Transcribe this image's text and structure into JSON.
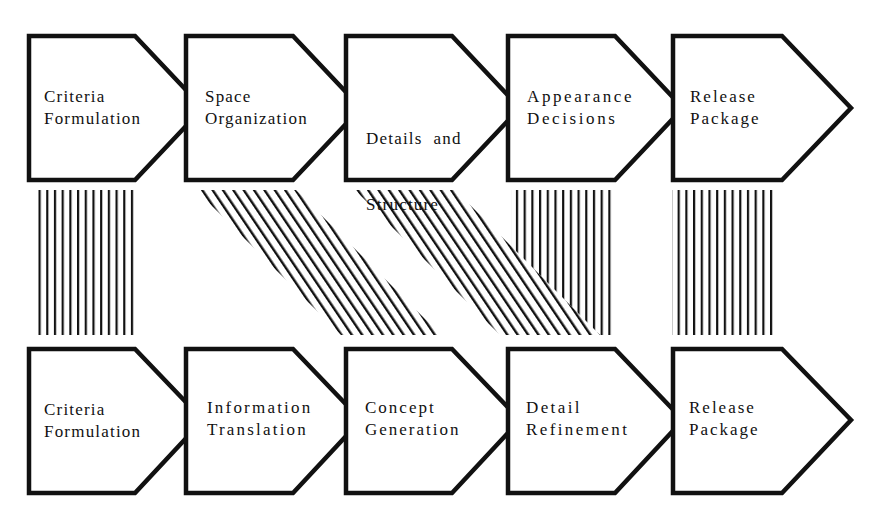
{
  "diagram": {
    "type": "process-mapping",
    "colors": {
      "stroke": "#111111",
      "background": "#ffffff"
    },
    "top_row": {
      "name": "process-a",
      "steps": [
        {
          "line1": "Criteria",
          "line2": "Formulation"
        },
        {
          "line1": "Space",
          "line2": "Organization"
        },
        {
          "line1": "Details  and",
          "line2": "Structure"
        },
        {
          "line1": "Appearance",
          "line2": "Decisions"
        },
        {
          "line1": "Release",
          "line2": "Package"
        }
      ]
    },
    "bottom_row": {
      "name": "process-b",
      "steps": [
        {
          "line1": "Criteria",
          "line2": "Formulation"
        },
        {
          "line1": "Information",
          "line2": "Translation"
        },
        {
          "line1": "Concept",
          "line2": "Generation"
        },
        {
          "line1": "Detail",
          "line2": "Refinement"
        },
        {
          "line1": "Release",
          "line2": "Package"
        }
      ]
    },
    "connections": [
      {
        "from": "top.0",
        "to": "bottom.0",
        "style": "vertical-hatch"
      },
      {
        "from": "top.1",
        "to": "bottom.2",
        "style": "diagonal-hatch"
      },
      {
        "from": "top.2",
        "to": "bottom.3",
        "style": "diagonal-hatch"
      },
      {
        "from": "top.3",
        "to": "bottom.3",
        "style": "vertical-hatch"
      },
      {
        "from": "top.4",
        "to": "bottom.4",
        "style": "vertical-hatch"
      }
    ]
  }
}
